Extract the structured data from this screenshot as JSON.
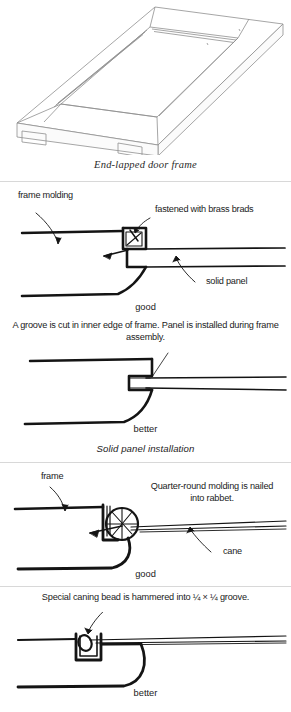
{
  "figures": [
    {
      "id": "end-lapped-door-frame",
      "kind": "isometric-line-drawing",
      "caption": "End-lapped door frame"
    },
    {
      "id": "solid-panel-good",
      "kind": "cross-section",
      "labels": [
        {
          "name": "frame-molding",
          "text": "frame molding"
        },
        {
          "name": "brass-brads",
          "text": "fastened with brass brads"
        },
        {
          "name": "solid-panel",
          "text": "solid panel"
        }
      ],
      "rating": "good"
    },
    {
      "id": "solid-panel-better",
      "kind": "cross-section",
      "note": "A groove is cut in inner edge of frame. Panel is installed during frame assembly.",
      "rating": "better"
    },
    {
      "id": "cane-panel-good",
      "kind": "cross-section",
      "labels": [
        {
          "name": "frame",
          "text": "frame"
        },
        {
          "name": "quarter-round-molding",
          "text": "Quarter-round molding is nailed into rabbet."
        },
        {
          "name": "cane",
          "text": "cane"
        }
      ],
      "rating": "good"
    },
    {
      "id": "cane-panel-better",
      "kind": "cross-section",
      "note": "Special caning bead is hammered into ¼ × ¼ groove.",
      "rating": "better"
    }
  ],
  "section_titles": {
    "solid_panel": "Solid panel installation"
  },
  "colors": {
    "ink": "#111111",
    "thin_line": "#8a8a8a",
    "rule": "#d8d8d8",
    "background": "#ffffff"
  }
}
